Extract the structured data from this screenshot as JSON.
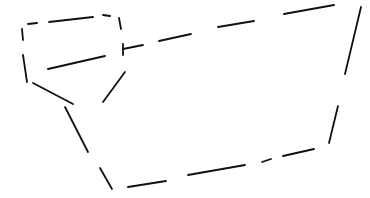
{
  "drawing": {
    "description": "Dashed line sketch of a closed polygon shape with an inner rectangular compartment",
    "stroke_color": "#111111",
    "stroke_width": 1.8,
    "background": "#ffffff",
    "width": 370,
    "height": 198,
    "groups": [
      {
        "name": "top-left-box",
        "segments": [
          [
            28,
            24,
            37,
            23
          ],
          [
            49,
            22,
            93,
            17
          ],
          [
            103,
            15,
            110,
            16
          ],
          [
            119,
            18,
            121,
            29
          ],
          [
            22,
            29,
            23,
            40
          ],
          [
            23,
            55,
            27,
            82
          ],
          [
            48,
            69,
            105,
            56
          ]
        ]
      },
      {
        "name": "top-edge",
        "segments": [
          [
            123,
            44,
            123,
            55
          ],
          [
            123,
            49,
            143,
            45
          ],
          [
            159,
            41,
            191,
            34
          ],
          [
            218,
            27,
            254,
            21
          ],
          [
            284,
            14,
            334,
            5
          ]
        ]
      },
      {
        "name": "right-edge",
        "segments": [
          [
            361,
            7,
            345,
            74
          ],
          [
            338,
            106,
            329,
            143
          ]
        ]
      },
      {
        "name": "bottom-edge",
        "segments": [
          [
            314,
            149,
            283,
            156
          ],
          [
            271,
            159,
            262,
            162
          ],
          [
            245,
            165,
            188,
            175
          ],
          [
            166,
            181,
            128,
            187
          ]
        ]
      },
      {
        "name": "left-edge",
        "segments": [
          [
            112,
            189,
            100,
            168
          ],
          [
            88,
            152,
            65,
            107
          ],
          [
            33,
            83,
            73,
            104
          ],
          [
            125,
            72,
            103,
            102
          ]
        ]
      }
    ]
  }
}
